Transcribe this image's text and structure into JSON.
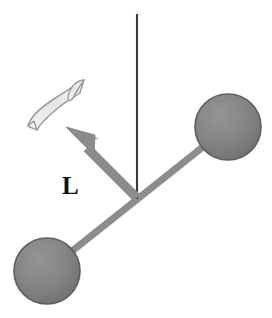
{
  "figure": {
    "width": 272,
    "height": 318,
    "background_color": "#ffffff"
  },
  "labels": {
    "angular_momentum": "L"
  },
  "colors": {
    "background": "#ffffff",
    "sphere_fill": "#828282",
    "sphere_rim": "#5f5f5f",
    "rod": "#8c8c8c",
    "axis_line": "#3a3a3a",
    "vector_arrow": "#8c8c8c",
    "vector_arrow_edge": "#7a7a7a",
    "rotation_arrow_fill": "#ededed",
    "rotation_arrow_stroke": "#9a9a9a",
    "label_text": "#111111"
  },
  "geometry": {
    "pivot": {
      "x": 137,
      "y": 198
    },
    "axis_line": {
      "x1": 137,
      "y1": 14,
      "x2": 137,
      "y2": 199
    },
    "rod": {
      "x1": 47,
      "y1": 271,
      "x2": 228,
      "y2": 127,
      "width": 7
    },
    "sphere_upper_right": {
      "cx": 228,
      "cy": 127,
      "r": 33
    },
    "sphere_lower_left": {
      "cx": 47,
      "cy": 271,
      "r": 33
    },
    "angular_momentum_vector": {
      "tail_x": 137,
      "tail_y": 198,
      "tip_x": 66,
      "tip_y": 127,
      "shaft_width": 9,
      "head_length": 30,
      "head_width": 26
    },
    "label_position": {
      "x": 62,
      "y": 194
    },
    "rotation_arrow": {
      "tail": {
        "x": 28,
        "y": 126
      },
      "head": {
        "x": 86,
        "y": 79
      }
    }
  },
  "elements": {
    "axis_name": "rotation-axis-line",
    "rod_name": "connecting-rod",
    "sphere_a_name": "mass-sphere-upper-right",
    "sphere_b_name": "mass-sphere-lower-left",
    "vector_name": "angular-momentum-vector",
    "rotation_name": "rotation-direction-arrow"
  }
}
